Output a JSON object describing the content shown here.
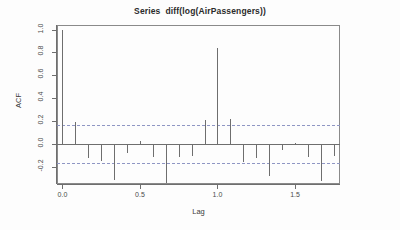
{
  "chart_data": {
    "type": "bar",
    "title": "Series  diff(log(AirPassengers))",
    "xlabel": "Lag",
    "ylabel": "ACF",
    "xlim": [
      -0.035,
      1.79
    ],
    "ylim": [
      -0.35,
      1.04
    ],
    "xticks": [
      0.0,
      0.5,
      1.0,
      1.5
    ],
    "xticklabels": [
      "0.0",
      "0.5",
      "1.0",
      "1.5"
    ],
    "yticks": [
      1.0,
      0.8,
      0.6,
      0.4,
      0.2,
      0.0,
      -0.2
    ],
    "yticklabels": [
      "1.0",
      "0.8",
      "0.6",
      "0.4",
      "0.2",
      "0.0",
      "-0.2"
    ],
    "grid": false,
    "legend": null,
    "confidence_level": 0.95,
    "confidence_bounds": [
      0.1636,
      -0.1636
    ],
    "confidence_line_style": "dashed",
    "confidence_color": "#8f96c4",
    "series_color": "#6e6e6e",
    "x": [
      0.0,
      0.0833,
      0.1667,
      0.25,
      0.3333,
      0.4167,
      0.5,
      0.5833,
      0.6667,
      0.75,
      0.8333,
      0.9167,
      1.0,
      1.0833,
      1.1667,
      1.25,
      1.3333,
      1.4167,
      1.5,
      1.5833,
      1.6667,
      1.75
    ],
    "values": [
      1.0,
      0.196,
      -0.121,
      -0.147,
      -0.316,
      -0.082,
      0.022,
      -0.112,
      -0.338,
      -0.116,
      -0.109,
      0.206,
      0.842,
      0.218,
      -0.154,
      -0.12,
      -0.277,
      -0.054,
      0.007,
      -0.117,
      -0.323,
      -0.101
    ],
    "lag_unit": "years",
    "n_lags": 22
  },
  "axes": {
    "y_title": "ACF",
    "x_title": "Lag"
  },
  "header": {
    "title": "Series  diff(log(AirPassengers))"
  }
}
